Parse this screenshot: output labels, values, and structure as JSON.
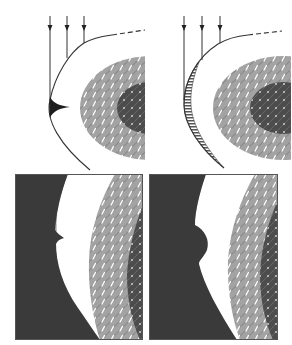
{
  "figure": {
    "panels": [
      {
        "id": "top-left",
        "feature": "sharp-spike"
      },
      {
        "id": "top-right",
        "feature": "striped-crescent"
      },
      {
        "id": "bottom-left",
        "feature": "small-notch"
      },
      {
        "id": "bottom-right",
        "feature": "rounded-bulge"
      }
    ],
    "arrows_per_top_panel": 3
  },
  "colors": {
    "background": "#ffffff",
    "line": "#333333",
    "dark_fill": "#3a3a3a",
    "hatch_light": "#9a9a9a",
    "hatch_dark": "#555555",
    "core": "#4a4a4a",
    "white": "#ffffff"
  }
}
